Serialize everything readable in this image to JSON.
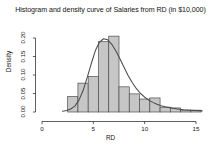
{
  "chart_data": {
    "type": "bar",
    "title": "Histogram and density curve of Salaries from RD (in $10,000)",
    "xlabel": "RD",
    "ylabel": "Density",
    "xlim": [
      0,
      15.6
    ],
    "ylim": [
      0,
      0.215
    ],
    "grid": false,
    "legend": null,
    "xticks": [
      0,
      5,
      10,
      15
    ],
    "xtick_labels": [
      "0",
      "5",
      "10",
      "15"
    ],
    "yticks": [
      0.0,
      0.05,
      0.1,
      0.15,
      0.2
    ],
    "ytick_labels": [
      "0.00",
      "0.05",
      "0.10",
      "0.15",
      "0.20"
    ],
    "bin_edges": [
      2.5,
      3.5,
      4.5,
      5.5,
      6.5,
      7.5,
      8.5,
      9.5,
      10.5,
      11.5,
      12.5,
      13.5,
      14.5,
      15.5
    ],
    "categories": [
      "2.5-3.5",
      "3.5-4.5",
      "4.5-5.5",
      "5.5-6.5",
      "6.5-7.5",
      "7.5-8.5",
      "8.5-9.5",
      "9.5-10.5",
      "10.5-11.5",
      "11.5-12.5",
      "12.5-13.5",
      "13.5-14.5",
      "14.5-15.5"
    ],
    "values": [
      0.042,
      0.078,
      0.096,
      0.19,
      0.205,
      0.068,
      0.049,
      0.035,
      0.038,
      0.013,
      0.011,
      0.005,
      0.005
    ],
    "bar_fill_color": "#c6c6c6",
    "bar_border_color": "#4d4d4d",
    "density_curve": {
      "name": "density",
      "color": "#4a4a4a",
      "x": [
        2.0,
        2.4,
        2.8,
        3.2,
        3.6,
        4.0,
        4.4,
        4.8,
        5.2,
        5.6,
        6.0,
        6.4,
        6.8,
        7.2,
        7.6,
        8.0,
        8.4,
        8.8,
        9.2,
        9.6,
        10.0,
        10.4,
        10.8,
        11.2,
        11.6,
        12.0,
        12.6,
        13.2,
        13.8,
        14.4,
        15.0,
        15.6
      ],
      "y": [
        0.002,
        0.004,
        0.008,
        0.016,
        0.032,
        0.058,
        0.093,
        0.131,
        0.166,
        0.189,
        0.198,
        0.195,
        0.183,
        0.165,
        0.143,
        0.12,
        0.098,
        0.079,
        0.063,
        0.05,
        0.04,
        0.032,
        0.026,
        0.021,
        0.017,
        0.014,
        0.011,
        0.008,
        0.006,
        0.005,
        0.004,
        0.003
      ]
    }
  }
}
